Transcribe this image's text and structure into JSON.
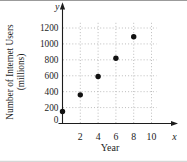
{
  "chart_data": {
    "type": "scatter",
    "title": "",
    "xlabel": "Year",
    "ylabel": "Number of Internet Users (millions)",
    "ylabel_line1": "Number of Internet Users",
    "ylabel_line2": "(millions)",
    "x_axis_letter": "x",
    "y_axis_letter": "y",
    "x": [
      0,
      2,
      4,
      6,
      8
    ],
    "y": [
      150,
      360,
      590,
      820,
      1090
    ],
    "x_ticks": [
      2,
      4,
      6,
      8,
      10
    ],
    "y_ticks": [
      0,
      200,
      400,
      600,
      800,
      1000,
      1200
    ],
    "xlim": [
      0,
      11
    ],
    "ylim": [
      0,
      1300
    ],
    "grid": "dotted",
    "legend": "none",
    "point_color": "#111111",
    "axis_color": "#1c1c1c",
    "grid_color": "#b5b5b5",
    "background": "#ffffff",
    "border_top_color": "#9b9b9b",
    "border_bottom_color": "#cccccc"
  }
}
